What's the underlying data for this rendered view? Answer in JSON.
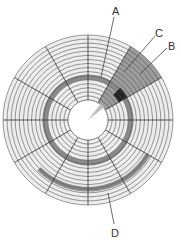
{
  "diagram": {
    "center": [
      88,
      120
    ],
    "outer_radius": 85,
    "inner_radius": 20,
    "track_count": 16,
    "sector_count": 12,
    "colors": {
      "disk_fill": "#ededed",
      "track_line": "#555555",
      "sector_line": "#333333",
      "highlight_track": "#8a8a8a",
      "highlight_sector": "#9c9c9c",
      "sector_wedge_inner": "#bdbdbd",
      "cluster_block": "#222222",
      "label_text": "#333333"
    },
    "labels": {
      "a": "A",
      "b": "B",
      "c": "C",
      "d": "D"
    }
  }
}
